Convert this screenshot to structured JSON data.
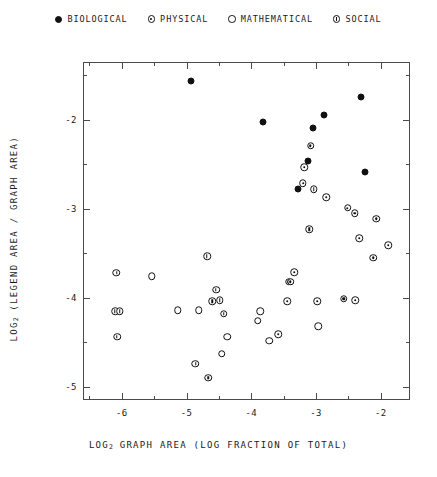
{
  "chart_data": {
    "type": "scatter",
    "title": "",
    "xlabel": "LOG2 GRAPH AREA (LOG FRACTION OF TOTAL)",
    "ylabel": "LOG2 (LEGEND AREA / GRAPH AREA)",
    "xlim": [
      -6.6,
      -1.55
    ],
    "ylim": [
      -5.15,
      -1.35
    ],
    "xticks": [
      -6,
      -5,
      -4,
      -3,
      -2
    ],
    "xticklabels": [
      "-6",
      "-5",
      "-4",
      "-3",
      "-2"
    ],
    "xminorticks": [
      -6.5,
      -5.5,
      -4.5,
      -3.5,
      -2.5,
      -1.5
    ],
    "yticks": [
      -2,
      -3,
      -4,
      -5
    ],
    "yticklabels": [
      "-2",
      "-3",
      "-4",
      "-5"
    ],
    "yminorticks": [
      -1.5,
      -2.5,
      -3.5,
      -4.5
    ],
    "grid": false,
    "legend_position": "top-center",
    "series": [
      {
        "name": "BIOLOGICAL",
        "marker": "filled-circle",
        "color": "#111111",
        "points": [
          [
            -4.95,
            -1.55
          ],
          [
            -3.84,
            -2.01
          ],
          [
            -2.32,
            -1.73
          ],
          [
            -2.9,
            -1.93
          ],
          [
            -3.07,
            -2.08
          ],
          [
            -3.14,
            -2.45
          ],
          [
            -3.3,
            -2.77
          ],
          [
            -2.26,
            -2.58
          ]
        ]
      },
      {
        "name": "PHYSICAL",
        "marker": "dotted-circle",
        "color": "#111111",
        "points": [
          [
            -3.1,
            -2.28
          ],
          [
            -3.2,
            -2.52
          ],
          [
            -3.22,
            -2.7
          ],
          [
            -2.86,
            -2.86
          ],
          [
            -2.53,
            -2.98
          ],
          [
            -2.42,
            -3.04
          ],
          [
            -2.09,
            -3.1
          ],
          [
            -2.35,
            -3.32
          ],
          [
            -1.9,
            -3.4
          ],
          [
            -2.13,
            -3.54
          ],
          [
            -3.35,
            -3.7
          ],
          [
            -3.44,
            -3.81
          ],
          [
            -3.41,
            -3.81
          ],
          [
            -3.46,
            -4.03
          ],
          [
            -2.59,
            -4.0
          ],
          [
            -2.41,
            -4.02
          ],
          [
            -3.0,
            -4.03
          ],
          [
            -3.6,
            -4.4
          ]
        ]
      },
      {
        "name": "MATHEMATICAL",
        "marker": "open-circle",
        "color": "#111111",
        "points": [
          [
            -5.55,
            -3.75
          ],
          [
            -5.15,
            -4.13
          ],
          [
            -4.83,
            -4.13
          ],
          [
            -4.39,
            -4.43
          ],
          [
            -4.47,
            -4.62
          ],
          [
            -3.88,
            -4.14
          ],
          [
            -3.92,
            -4.25
          ],
          [
            -3.74,
            -4.47
          ],
          [
            -2.98,
            -4.31
          ]
        ]
      },
      {
        "name": "SOCIAL",
        "marker": "barred-circle",
        "color": "#111111",
        "points": [
          [
            -6.1,
            -3.71
          ],
          [
            -6.12,
            -4.14
          ],
          [
            -6.05,
            -4.14
          ],
          [
            -6.09,
            -4.43
          ],
          [
            -4.7,
            -3.52
          ],
          [
            -4.56,
            -3.9
          ],
          [
            -4.62,
            -4.03
          ],
          [
            -4.5,
            -4.02
          ],
          [
            -4.44,
            -4.17
          ],
          [
            -3.05,
            -2.77
          ],
          [
            -3.12,
            -3.22
          ],
          [
            -4.88,
            -4.73
          ],
          [
            -4.68,
            -4.89
          ]
        ]
      }
    ]
  },
  "legend": {
    "entries": [
      {
        "label": "BIOLOGICAL",
        "marker": "filled-circle"
      },
      {
        "label": "PHYSICAL",
        "marker": "dotted-circle"
      },
      {
        "label": "MATHEMATICAL",
        "marker": "open-circle"
      },
      {
        "label": "SOCIAL",
        "marker": "barred-circle"
      }
    ]
  },
  "axes": {
    "x_title_pre": "LOG",
    "x_title_sub": "2",
    "x_title_post": " GRAPH AREA (LOG FRACTION OF TOTAL)",
    "y_title_pre": "LOG",
    "y_title_sub": "2",
    "y_title_post": " (LEGEND AREA / GRAPH AREA)"
  }
}
